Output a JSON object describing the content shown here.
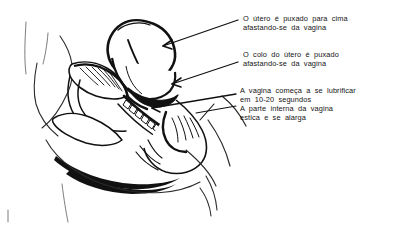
{
  "figure": {
    "type": "anatomical-line-drawing",
    "background_color": "#ffffff",
    "ink_color": "#111111",
    "text_color": "#141414"
  },
  "annotations": [
    {
      "id": "uterus",
      "name": "annotation-uterus",
      "line1": "O útero é puxado para cima",
      "line2": "afastando-se  da  vagina",
      "leader": "arrow"
    },
    {
      "id": "cervix",
      "name": "annotation-cervix",
      "line1": "O colo do útero é puxado",
      "line2": "afastando-se  da  vagina",
      "leader": "arrow"
    },
    {
      "id": "lubrication",
      "name": "annotation-lubrication",
      "line1": "A vagina começa a se lubrificar",
      "line2": "em 10-20 segundos",
      "leader": "line"
    },
    {
      "id": "stretch",
      "name": "annotation-inner-vagina",
      "line1": "A parte interna da vagina",
      "line2": "estica e se alarga",
      "leader": "line"
    }
  ],
  "structures": [
    {
      "id": "uterus",
      "label": "útero"
    },
    {
      "id": "cervix",
      "label": "colo do útero"
    },
    {
      "id": "vagina",
      "label": "vagina"
    },
    {
      "id": "bladder",
      "label": "bexiga"
    },
    {
      "id": "pubic-bone",
      "label": "osso púbico"
    },
    {
      "id": "sacrum",
      "label": "sacro"
    },
    {
      "id": "rectum",
      "label": "reto"
    },
    {
      "id": "body-contour",
      "label": "contorno do corpo"
    }
  ]
}
